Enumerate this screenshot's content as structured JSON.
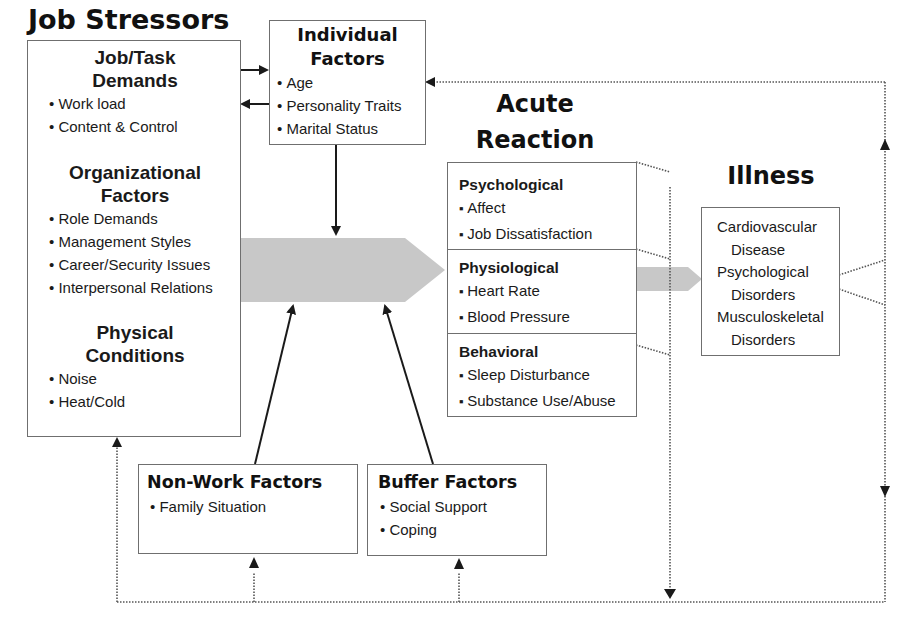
{
  "diagram": {
    "job_stressors": {
      "title": "Job Stressors",
      "sections": [
        {
          "heading_line1": "Job/Task",
          "heading_line2": "Demands",
          "items": [
            "Work load",
            "Content & Control"
          ]
        },
        {
          "heading_line1": "Organizational",
          "heading_line2": "Factors",
          "items": [
            "Role Demands",
            "Management Styles",
            "Career/Security Issues",
            "Interpersonal Relations"
          ]
        },
        {
          "heading_line1": "Physical",
          "heading_line2": "Conditions",
          "items": [
            "Noise",
            "Heat/Cold"
          ]
        }
      ]
    },
    "individual_factors": {
      "title_line1": "Individual",
      "title_line2": "Factors",
      "items": [
        "Age",
        "Personality Traits",
        "Marital Status"
      ]
    },
    "acute_reaction": {
      "title_line1": "Acute",
      "title_line2": "Reaction",
      "sections": [
        {
          "heading": "Psychological",
          "items": [
            "Affect",
            "Job Dissatisfaction"
          ]
        },
        {
          "heading": "Physiological",
          "items": [
            "Heart Rate",
            "Blood Pressure"
          ]
        },
        {
          "heading": "Behavioral",
          "items": [
            "Sleep Disturbance",
            "Substance Use/Abuse"
          ]
        }
      ]
    },
    "illness": {
      "title": "Illness",
      "lines": [
        "Cardiovascular",
        "Disease",
        "Psychological",
        "Disorders",
        "Musculoskeletal",
        "Disorders"
      ]
    },
    "non_work_factors": {
      "title": "Non-Work Factors",
      "items": [
        "Family Situation"
      ]
    },
    "buffer_factors": {
      "title": "Buffer Factors",
      "items": [
        "Social Support",
        "Coping"
      ]
    },
    "colors": {
      "main_arrow": "#c8c8c8",
      "box_border": "#6f6f6f",
      "line": "#1a1a1a",
      "dotted": "#555555"
    }
  }
}
